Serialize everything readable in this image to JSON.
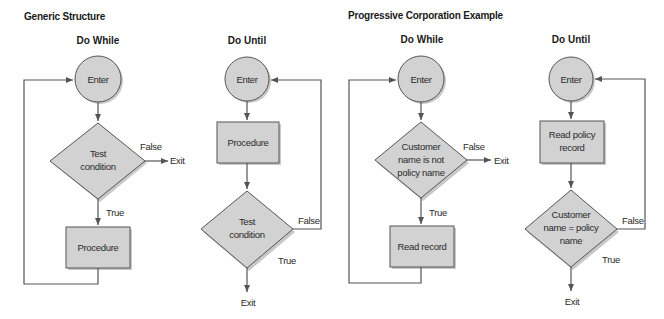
{
  "sections": {
    "generic": {
      "title": "Generic Structure",
      "do_while": {
        "title": "Do While",
        "enter": "Enter",
        "condition": [
          "Test",
          "condition"
        ],
        "false_label": "False",
        "exit": "Exit",
        "true_label": "True",
        "procedure": [
          "Procedure"
        ]
      },
      "do_until": {
        "title": "Do Until",
        "enter": "Enter",
        "procedure": [
          "Procedure"
        ],
        "condition": [
          "Test",
          "condition"
        ],
        "false_label": "False",
        "true_label": "True",
        "exit": "Exit"
      }
    },
    "example": {
      "title": "Progressive Corporation Example",
      "do_while": {
        "title": "Do While",
        "enter": "Enter",
        "condition": [
          "Customer",
          "name is not",
          "policy name"
        ],
        "false_label": "False",
        "exit": "Exit",
        "true_label": "True",
        "procedure": [
          "Read record"
        ]
      },
      "do_until": {
        "title": "Do Until",
        "enter": "Enter",
        "procedure": [
          "Read policy",
          "record"
        ],
        "condition": [
          "Customer",
          "name = policy",
          "name"
        ],
        "false_label": "False",
        "true_label": "True",
        "exit": "Exit"
      }
    }
  },
  "colors": {
    "shape_fill": "#d2d2d2",
    "stroke": "#555555",
    "text": "#1a1a1a"
  }
}
